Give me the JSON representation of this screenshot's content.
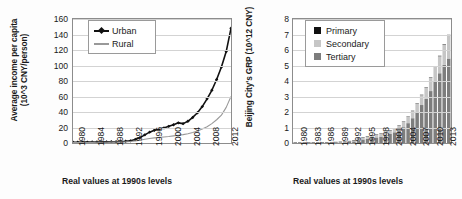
{
  "figure": {
    "background": "#ffffff",
    "panels": [
      "left",
      "right"
    ]
  },
  "left_panel": {
    "ylabel_line1": "Average income per capita",
    "ylabel_line2": "(10^3 CNY/person)",
    "caption": "Real values at 1990s levels",
    "legend": [
      {
        "label": "Urban",
        "color": "#111111",
        "marker": "diamond"
      },
      {
        "label": "Rural",
        "color": "#999999",
        "marker": "none"
      }
    ]
  },
  "right_panel": {
    "ylabel": "Beijing City's GRP (10^12 CNY)",
    "caption": "Real values at 1990s levels",
    "legend": [
      {
        "label": "Primary",
        "color": "#111111"
      },
      {
        "label": "Secondary",
        "color": "#c6c6c6"
      },
      {
        "label": "Tertiary",
        "color": "#7d7d7d"
      }
    ]
  },
  "chart_data": [
    {
      "type": "line",
      "id": "average-income-per-capita",
      "title": "",
      "xlabel": "Real values at 1990s levels",
      "ylabel": "Average income per capita (10^3 CNY/person)",
      "ylim": [
        0,
        160
      ],
      "yticks": [
        0,
        20,
        40,
        60,
        80,
        100,
        120,
        140,
        160
      ],
      "xlim": [
        1980,
        2013
      ],
      "xticks": [
        1980,
        1984,
        1988,
        1992,
        1996,
        2000,
        2004,
        2008,
        2012
      ],
      "grid": true,
      "legend_position": "top-left",
      "x": [
        1980,
        1981,
        1982,
        1983,
        1984,
        1985,
        1986,
        1987,
        1988,
        1989,
        1990,
        1991,
        1992,
        1993,
        1994,
        1995,
        1996,
        1997,
        1998,
        1999,
        2000,
        2001,
        2002,
        2003,
        2004,
        2005,
        2006,
        2007,
        2008,
        2009,
        2010,
        2011,
        2012,
        2013
      ],
      "series": [
        {
          "name": "Urban",
          "color": "#111111",
          "marker": "diamond",
          "values": [
            1.0,
            1.0,
            1.1,
            1.1,
            1.2,
            1.3,
            1.4,
            1.5,
            1.6,
            1.7,
            1.9,
            2.2,
            2.8,
            4.5,
            7.0,
            10.5,
            14.0,
            16.5,
            18.0,
            19.5,
            21.5,
            23.5,
            26.0,
            25.0,
            28.0,
            33.0,
            39.0,
            47.0,
            57.0,
            68.0,
            82.0,
            98.0,
            118.0,
            148.0
          ]
        },
        {
          "name": "Rural",
          "color": "#999999",
          "marker": "none",
          "values": [
            0.6,
            0.6,
            0.7,
            0.7,
            0.8,
            0.9,
            1.0,
            1.0,
            1.1,
            1.2,
            1.3,
            1.5,
            1.9,
            2.6,
            3.6,
            4.8,
            5.8,
            6.6,
            7.2,
            7.8,
            8.4,
            9.2,
            10.0,
            10.8,
            12.0,
            13.5,
            15.5,
            18.0,
            21.0,
            25.0,
            30.0,
            36.0,
            46.0,
            60.0
          ]
        }
      ]
    },
    {
      "type": "bar",
      "id": "beijing-city-grp",
      "stacked": true,
      "title": "",
      "xlabel": "Real values at 1990s levels",
      "ylabel": "Beijing City's GRP (10^12 CNY)",
      "ylim": [
        0,
        8
      ],
      "yticks": [
        0,
        1,
        2,
        3,
        4,
        5,
        6,
        7,
        8
      ],
      "grid": true,
      "legend_position": "top-left",
      "categories": [
        1980,
        1981,
        1982,
        1983,
        1984,
        1985,
        1986,
        1987,
        1988,
        1989,
        1990,
        1991,
        1992,
        1993,
        1994,
        1995,
        1996,
        1997,
        1998,
        1999,
        2000,
        2001,
        2002,
        2003,
        2004,
        2005,
        2006,
        2007,
        2008,
        2009,
        2010,
        2011,
        2012,
        2013,
        2014
      ],
      "xticks": [
        1980,
        1983,
        1986,
        1989,
        1992,
        1995,
        1998,
        2001,
        2004,
        2007,
        2010,
        2013
      ],
      "series": [
        {
          "name": "Primary",
          "color": "#111111",
          "values": [
            0.002,
            0.002,
            0.002,
            0.003,
            0.003,
            0.003,
            0.004,
            0.004,
            0.004,
            0.005,
            0.005,
            0.006,
            0.007,
            0.008,
            0.01,
            0.012,
            0.013,
            0.014,
            0.015,
            0.016,
            0.016,
            0.017,
            0.018,
            0.018,
            0.02,
            0.02,
            0.021,
            0.022,
            0.023,
            0.024,
            0.025,
            0.026,
            0.027,
            0.028,
            0.029
          ]
        },
        {
          "name": "Secondary",
          "color": "#c6c6c6",
          "values": [
            0.012,
            0.013,
            0.014,
            0.016,
            0.018,
            0.021,
            0.024,
            0.028,
            0.032,
            0.034,
            0.038,
            0.045,
            0.058,
            0.075,
            0.1,
            0.125,
            0.145,
            0.16,
            0.175,
            0.19,
            0.215,
            0.235,
            0.255,
            0.29,
            0.34,
            0.4,
            0.46,
            0.54,
            0.64,
            0.72,
            0.86,
            0.98,
            1.1,
            1.3,
            1.5
          ]
        },
        {
          "name": "Tertiary",
          "color": "#7d7d7d",
          "values": [
            0.01,
            0.011,
            0.012,
            0.014,
            0.016,
            0.019,
            0.022,
            0.026,
            0.03,
            0.033,
            0.038,
            0.048,
            0.07,
            0.105,
            0.17,
            0.23,
            0.28,
            0.32,
            0.36,
            0.41,
            0.49,
            0.58,
            0.69,
            0.83,
            1.02,
            1.28,
            1.6,
            2.0,
            2.45,
            2.85,
            3.35,
            3.95,
            4.5,
            5.05,
            5.45
          ]
        }
      ]
    }
  ]
}
